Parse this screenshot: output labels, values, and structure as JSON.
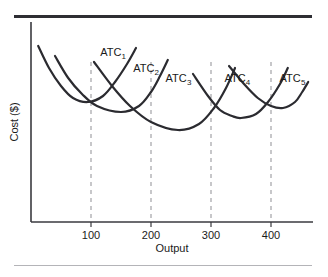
{
  "figure": {
    "background_color": "#ffffff",
    "top_rule_color": "#2e2e33",
    "bottom_rule_color": "#b4b4b8"
  },
  "chart_data": {
    "type": "line",
    "title": "",
    "xlabel": "Output",
    "ylabel": "Cost ($)",
    "xlim": [
      0,
      470
    ],
    "ylim": [
      0,
      100
    ],
    "grid": false,
    "legend": "none",
    "axis_color": "#3a3a3f",
    "curve_color": "#2b2b30",
    "guide_color": "#9a9a9e",
    "guide_style": "dashed",
    "xticks": [
      100,
      200,
      300,
      400
    ],
    "xticklabels": [
      "100",
      "200",
      "300",
      "400"
    ],
    "yticks": [],
    "yticklabels": [],
    "guides_at_x": [
      100,
      200,
      300,
      400
    ],
    "annotations": [
      {
        "text": "ATC",
        "subscript": "1",
        "x": 133,
        "y": 83
      },
      {
        "text": "ATC",
        "subscript": "2",
        "x": 188,
        "y": 75
      },
      {
        "text": "ATC",
        "subscript": "3",
        "x": 242,
        "y": 70
      },
      {
        "text": "ATC",
        "subscript": "4",
        "x": 340,
        "y": 70
      },
      {
        "text": "ATC",
        "subscript": "5",
        "x": 432,
        "y": 70
      }
    ],
    "series": [
      {
        "name": "ATC1",
        "label": "ATC₁",
        "minimum_x": 95,
        "minimum_y": 60,
        "x": [
          12,
          30,
          50,
          70,
          95,
          120,
          140,
          160,
          175
        ],
        "y": [
          88,
          77,
          68,
          62,
          60,
          63,
          70,
          79,
          87
        ]
      },
      {
        "name": "ATC2",
        "label": "ATC₂",
        "minimum_x": 150,
        "minimum_y": 55,
        "x": [
          40,
          62,
          85,
          110,
          150,
          180,
          200,
          215,
          228
        ],
        "y": [
          83,
          72,
          64,
          58,
          55,
          58,
          65,
          73,
          81
        ]
      },
      {
        "name": "ATC3",
        "label": "ATC₃",
        "minimum_x": 245,
        "minimum_y": 46,
        "x": [
          105,
          135,
          165,
          200,
          245,
          280,
          305,
          325,
          340
        ],
        "y": [
          80,
          68,
          58,
          50,
          46,
          49,
          57,
          67,
          77
        ]
      },
      {
        "name": "ATC4",
        "label": "ATC₄",
        "minimum_x": 350,
        "minimum_y": 52,
        "x": [
          270,
          295,
          315,
          335,
          350,
          375,
          395,
          415,
          428
        ],
        "y": [
          74,
          63,
          56,
          53,
          52,
          54,
          60,
          69,
          77
        ]
      },
      {
        "name": "ATC5",
        "label": "ATC₅",
        "minimum_x": 420,
        "minimum_y": 57,
        "x": [
          330,
          355,
          378,
          400,
          420,
          440,
          452,
          462
        ],
        "y": [
          78,
          69,
          62,
          58,
          57,
          60,
          65,
          70
        ]
      }
    ]
  }
}
